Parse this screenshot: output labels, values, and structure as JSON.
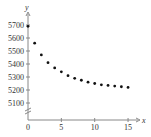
{
  "chart_data": {
    "type": "scatter",
    "title": "",
    "xlabel": "x",
    "ylabel": "y",
    "x_ticks": [
      0,
      5,
      10,
      15
    ],
    "y_ticks": [
      5100,
      5200,
      5300,
      5400,
      5500,
      5600,
      5700
    ],
    "xlim": [
      0,
      16
    ],
    "ylim": [
      5050,
      5750
    ],
    "y_axis_break": true,
    "grid": false,
    "legend": null,
    "x": [
      0,
      1,
      2,
      3,
      4,
      5,
      6,
      7,
      8,
      9,
      10,
      11,
      12,
      13,
      14,
      15
    ],
    "values": [
      5690,
      5560,
      5470,
      5410,
      5370,
      5340,
      5310,
      5290,
      5275,
      5260,
      5250,
      5240,
      5235,
      5230,
      5225,
      5220
    ]
  },
  "colors": {
    "axis": "#888888",
    "points": "#111111",
    "text": "#333333"
  }
}
